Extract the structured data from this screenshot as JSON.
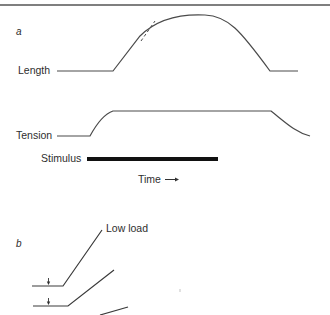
{
  "figure": {
    "panel_a": {
      "letter": "a",
      "length_label": "Length",
      "tension_label": "Tension",
      "stimulus_label": "Stimulus",
      "time_label": "Time",
      "time_arrow": "→"
    },
    "panel_b": {
      "letter": "b",
      "low_load_label": "Low load"
    }
  },
  "colors": {
    "line": "#4a4a4a",
    "stimulus_bar": "#111111",
    "rule": "#555555"
  }
}
